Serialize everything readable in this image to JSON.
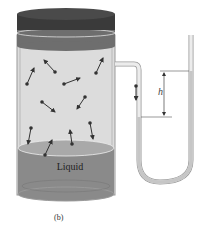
{
  "figure": {
    "caption": "(b)",
    "liquid_label": "Liquid",
    "height_label": "h",
    "colors": {
      "lid_top": "#3a3a3a",
      "lid_band": "#6e6e6e",
      "vapor": "#dcdcdc",
      "liquid": "#8a8a8a",
      "liquid_surface": "#a9a9a9",
      "tube_fluid": "#c6c6c6",
      "glass_edge": "#9a9a9a",
      "molecule": "#333333"
    },
    "molecules": [
      {
        "x": 55,
        "y": 72,
        "dx": -11,
        "dy": -12
      },
      {
        "x": 27,
        "y": 84,
        "dx": 7,
        "dy": -16
      },
      {
        "x": 64,
        "y": 84,
        "dx": 16,
        "dy": -6
      },
      {
        "x": 96,
        "y": 73,
        "dx": 7,
        "dy": -15
      },
      {
        "x": 42,
        "y": 102,
        "dx": 13,
        "dy": 10
      },
      {
        "x": 85,
        "y": 97,
        "dx": -8,
        "dy": 12
      },
      {
        "x": 31,
        "y": 128,
        "dx": -3,
        "dy": 16
      },
      {
        "x": 72,
        "y": 144,
        "dx": -2,
        "dy": -14
      },
      {
        "x": 90,
        "y": 123,
        "dx": 3,
        "dy": 16
      },
      {
        "x": 45,
        "y": 155,
        "dx": 7,
        "dy": -15
      },
      {
        "x": 136,
        "y": 86,
        "dx": 0,
        "dy": 14
      }
    ]
  }
}
